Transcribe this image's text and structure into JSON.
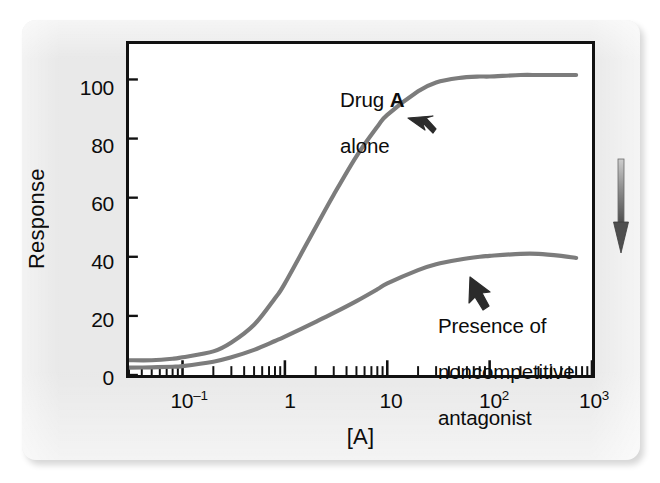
{
  "figure": {
    "background_color": "#e9e9e9",
    "plot_background_color": "#ffffff",
    "frame_color": "#111111",
    "curve_color": "#7c7c7c",
    "text_color": "#0c0c0c"
  },
  "annotations": {
    "drug_alone_line1_prefix": "Drug ",
    "drug_alone_line1_bold": "A",
    "drug_alone_line2": "alone",
    "antagonist_line1": "Presence of",
    "antagonist_line2": "noncompetitive",
    "antagonist_line3": "antagonist",
    "side_arrow_name": "downward-arrow"
  },
  "chart_data": {
    "type": "line",
    "title": "",
    "xlabel": "[A]",
    "ylabel": "Response",
    "xscale": "log",
    "xlim": [
      0.03,
      1000
    ],
    "ylim": [
      0,
      112
    ],
    "grid": false,
    "legend": "annotations-on-plot",
    "xtick_labels": [
      "10⁻¹",
      "1",
      "10",
      "10²",
      "10³"
    ],
    "xtick_label_parts": [
      {
        "base": "10",
        "exp": "–1"
      },
      {
        "base": "1",
        "exp": ""
      },
      {
        "base": "10",
        "exp": ""
      },
      {
        "base": "10",
        "exp": "2"
      },
      {
        "base": "10",
        "exp": "3"
      }
    ],
    "xtick_values": [
      0.1,
      1,
      10,
      100,
      1000
    ],
    "ytick_labels": [
      "0",
      "20",
      "40",
      "60",
      "80",
      "100"
    ],
    "ytick_values": [
      0,
      20,
      40,
      60,
      80,
      100
    ],
    "series": [
      {
        "name": "Drug A alone",
        "color": "#7c7c7c",
        "x": [
          0.03,
          0.05,
          0.08,
          0.1,
          0.2,
          0.3,
          0.5,
          0.8,
          1,
          2,
          3,
          5,
          8,
          10,
          20,
          30,
          50,
          80,
          100,
          200,
          300,
          500,
          700
        ],
        "y": [
          5,
          5,
          5.5,
          6,
          8,
          11,
          17,
          26,
          31,
          50,
          61,
          74,
          84,
          88,
          96,
          99,
          100.5,
          101,
          101,
          101.5,
          101.5,
          101.5,
          101.5
        ]
      },
      {
        "name": "Presence of noncompetitive antagonist",
        "color": "#7c7c7c",
        "x": [
          0.03,
          0.05,
          0.08,
          0.1,
          0.2,
          0.3,
          0.5,
          0.8,
          1,
          2,
          3,
          5,
          8,
          10,
          20,
          30,
          50,
          80,
          100,
          200,
          300,
          500,
          700
        ],
        "y": [
          2.5,
          2.6,
          2.8,
          3,
          4.5,
          6,
          8.5,
          11.5,
          13,
          18,
          21,
          25,
          29,
          31,
          35.5,
          37.5,
          39,
          40,
          40.3,
          41,
          41,
          40.3,
          39.6
        ]
      }
    ]
  }
}
